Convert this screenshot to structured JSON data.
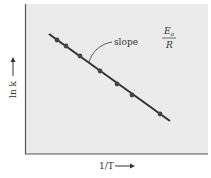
{
  "chart_data": {
    "type": "scatter",
    "title": "",
    "xlabel": "1/T",
    "ylabel": "ln k",
    "annotation": {
      "text": "slope",
      "value_numerator": "E",
      "value_numerator_subscript": "a",
      "value_denominator": "R",
      "sign": "-"
    },
    "grid": false,
    "legend": null,
    "axis_ticks": false,
    "points_px": [
      [
        57,
        40
      ],
      [
        66,
        46
      ],
      [
        80,
        56
      ],
      [
        100,
        71
      ],
      [
        117,
        84
      ],
      [
        132,
        95
      ],
      [
        160,
        114
      ]
    ],
    "fit_line_px": [
      [
        49,
        34
      ],
      [
        170,
        121
      ]
    ],
    "x": [
      1,
      2,
      3,
      4,
      5,
      6,
      7
    ],
    "y": [
      7,
      6.3,
      5.3,
      3.8,
      2.5,
      1.4,
      -0.5
    ],
    "note": "Relative positions only; axes unlabeled numerically (Arrhenius plot, linear decreasing)."
  },
  "labels": {
    "x_axis": "1/T",
    "y_axis": "ln k",
    "slope": "slope",
    "frac_num": "E",
    "frac_sub": "a",
    "frac_den": "R"
  },
  "colors": {
    "plot_bg": "#ebebeb",
    "axis": "#555555",
    "line": "#333333",
    "points": "#444444"
  }
}
